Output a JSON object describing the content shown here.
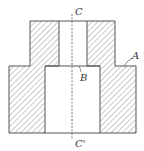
{
  "diagram": {
    "labels": {
      "top_axis": "C",
      "bottom_axis": "C'",
      "outer_step": "A",
      "inner_step": "B"
    },
    "colors": {
      "line": "#555555",
      "hatch": "#777777",
      "background": "#ffffff"
    }
  }
}
